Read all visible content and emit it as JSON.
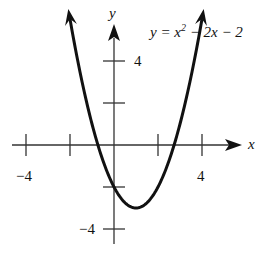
{
  "chart_data": {
    "type": "line",
    "title": "",
    "equation": "y = x² − 2x − 2",
    "equation_parts": {
      "lhs": "y = x",
      "exp": "2",
      "rhs": " − 2x − 2"
    },
    "xlabel": "x",
    "ylabel": "y",
    "xlim": [
      -4.3,
      4.9
    ],
    "ylim": [
      -4.6,
      6.3
    ],
    "x_ticks": [
      -4,
      -2,
      2,
      4
    ],
    "x_tick_labels": {
      "-4": "−4",
      "4": "4"
    },
    "y_ticks": [
      -4,
      -2,
      2,
      4
    ],
    "y_tick_labels": {
      "-4": "−4",
      "4": "4"
    },
    "grid": false,
    "series": [
      {
        "name": "y = x^2 - 2x - 2",
        "function": "x^2 - 2x - 2",
        "x_range": [
          -2.1,
          4.1
        ],
        "x": [
          -2.1,
          -2,
          -1.5,
          -1,
          -0.5,
          0,
          0.5,
          1,
          1.5,
          2,
          2.5,
          3,
          3.5,
          4,
          4.1
        ],
        "y": [
          6.61,
          6,
          3.25,
          1,
          -0.75,
          -2,
          -2.75,
          -3,
          -2.75,
          -2,
          -0.75,
          1,
          3.25,
          6,
          6.61
        ],
        "vertex": [
          1,
          -3
        ],
        "arrows_at_ends": true
      }
    ]
  },
  "labels": {
    "x_axis": "x",
    "y_axis": "y",
    "x_neg4": "−4",
    "x_pos4": "4",
    "y_pos4": "4",
    "y_neg4": "−4"
  }
}
